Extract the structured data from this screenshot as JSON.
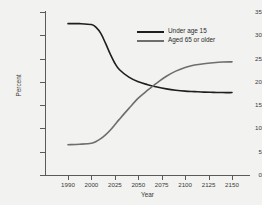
{
  "chart_data": {
    "type": "line",
    "title": "",
    "xlabel": "Year",
    "ylabel": "Percent",
    "grid": false,
    "legend_position": "upper-center-right",
    "x_categories": [
      "1990",
      "2000",
      "2025",
      "2050",
      "2075",
      "2100",
      "2125",
      "2150"
    ],
    "ylim": [
      0,
      35
    ],
    "y_ticks": [
      0,
      5,
      10,
      15,
      20,
      25,
      30,
      35
    ],
    "series": [
      {
        "name": "Under age 15",
        "color": "#1e1e1e",
        "x": [
          1990,
          1995,
          2000,
          2005,
          2010,
          2015,
          2020,
          2025,
          2030,
          2040,
          2050,
          2060,
          2070,
          2080,
          2090,
          2100,
          2110,
          2120,
          2130,
          2140,
          2150
        ],
        "values": [
          32.5,
          32.5,
          32.3,
          31.7,
          30.4,
          28.3,
          26.0,
          24.0,
          22.6,
          21.0,
          20.0,
          19.4,
          18.9,
          18.5,
          18.2,
          18.0,
          17.9,
          17.8,
          17.75,
          17.7,
          17.7
        ]
      },
      {
        "name": "Aged 65 or older",
        "color": "#6e6e6e",
        "x": [
          1990,
          1995,
          2000,
          2005,
          2010,
          2015,
          2020,
          2025,
          2030,
          2040,
          2050,
          2060,
          2070,
          2080,
          2090,
          2100,
          2110,
          2120,
          2130,
          2140,
          2150
        ],
        "values": [
          6.5,
          6.6,
          6.8,
          7.2,
          7.8,
          8.6,
          9.6,
          10.8,
          12.0,
          14.3,
          16.5,
          18.2,
          19.8,
          21.2,
          22.3,
          23.1,
          23.6,
          23.9,
          24.1,
          24.25,
          24.3
        ]
      }
    ],
    "crossover": {
      "x": 2072,
      "y": 19.0
    }
  },
  "axis": {
    "y_tick_labels": [
      "35",
      "30",
      "25",
      "20",
      "15",
      "10",
      "5",
      "0"
    ],
    "x_tick_labels": [
      "1990",
      "2000",
      "2025",
      "2050",
      "2075",
      "2100",
      "2125",
      "2150"
    ],
    "x_title": "Year",
    "y_title": "Percent"
  },
  "legend": {
    "items": [
      {
        "label": "Under age 15",
        "color": "#1e1e1e"
      },
      {
        "label": "Aged 65 or older",
        "color": "#6e6e6e"
      }
    ]
  }
}
